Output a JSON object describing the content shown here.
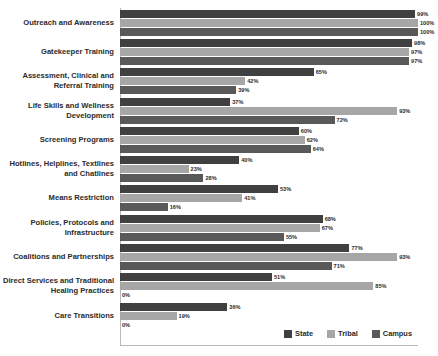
{
  "chart_data": {
    "type": "bar",
    "orientation": "horizontal",
    "title": "",
    "subtitle": "",
    "xlabel": "",
    "ylabel": "",
    "xlim": [
      0,
      100
    ],
    "grid": false,
    "value_suffix": "%",
    "legend_position": "bottom-right",
    "categories": [
      "Outreach and Awareness",
      "Gatekeeper Training",
      "Assessment, Clinical and Referral Training",
      "Life Skills and Wellness Development",
      "Screening Programs",
      "Hotlines, Helplines, Textlines and Chatlines",
      "Means Restriction",
      "Policies, Protocols and Infrastructure",
      "Coalitions and Partnerships",
      "Direct Services and Traditional Healing Practices",
      "Care Transitions"
    ],
    "series": [
      {
        "name": "State",
        "color": "#404040",
        "values": [
          99,
          98,
          65,
          37,
          60,
          40,
          53,
          68,
          77,
          51,
          36
        ],
        "labels": [
          "99%",
          "98%",
          "65%",
          "37%",
          "60%",
          "40%",
          "53%",
          "68%",
          "77%",
          "51%",
          "36%"
        ]
      },
      {
        "name": "Tribal",
        "color": "#a6a6a6",
        "values": [
          100,
          97,
          42,
          93,
          62,
          23,
          41,
          67,
          93,
          85,
          19
        ],
        "labels": [
          "100%",
          "97%",
          "42%",
          "93%",
          "62%",
          "23%",
          "41%",
          "67%",
          "93%",
          "85%",
          "19%"
        ]
      },
      {
        "name": "Campus",
        "color": "#595959",
        "values": [
          100,
          97,
          39,
          72,
          64,
          28,
          16,
          55,
          71,
          0,
          0
        ],
        "labels": [
          "100%",
          "97%",
          "39%",
          "72%",
          "64%",
          "28%",
          "16%",
          "55%",
          "71%",
          "0%",
          "0%"
        ]
      }
    ]
  },
  "legend": {
    "items": [
      {
        "label": "State",
        "color": "#404040"
      },
      {
        "label": "Tribal",
        "color": "#a6a6a6"
      },
      {
        "label": "Campus",
        "color": "#595959"
      }
    ]
  }
}
